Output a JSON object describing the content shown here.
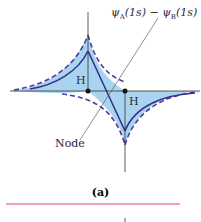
{
  "figure": {
    "wavefunction_label": {
      "psi_a": "ψ",
      "sub_a": "A",
      "arg_a": "(1s)",
      "minus": " − ",
      "psi_b": "ψ",
      "sub_b": "B",
      "arg_b": "(1s)"
    },
    "nucleus_left_label": "H",
    "nucleus_right_label": "H",
    "node_label": "Node",
    "caption": "(a)",
    "colors": {
      "fill": "#a9d4f0",
      "curve": "#3a2f8f",
      "dashed": "#4b3f9a",
      "dashed_accent": "#d0407a",
      "axis": "#333333",
      "rule": "#e0457f"
    }
  }
}
